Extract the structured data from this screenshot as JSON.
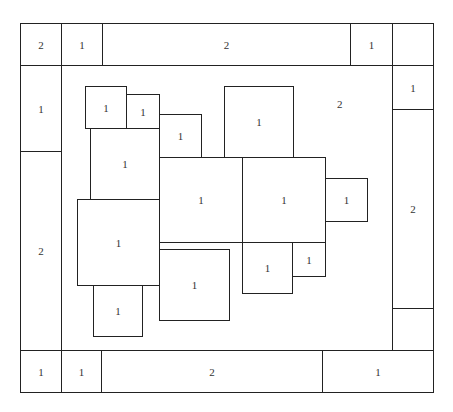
{
  "diagram": {
    "type": "rectangle-packing layout",
    "outer_frame": {
      "x": 20,
      "y": 23,
      "w": 413,
      "h": 369
    },
    "central_area": {
      "label": "2",
      "label_pos": {
        "x": 337,
        "y": 98
      }
    },
    "top_row": [
      {
        "label": "2",
        "x": 20,
        "y": 23,
        "w": 42,
        "h": 43
      },
      {
        "label": "1",
        "x": 61,
        "y": 23,
        "w": 42,
        "h": 43
      },
      {
        "label": "2",
        "x": 102,
        "y": 23,
        "w": 249,
        "h": 43
      },
      {
        "label": "1",
        "x": 350,
        "y": 23,
        "w": 43,
        "h": 43
      },
      {
        "label": "",
        "x": 392,
        "y": 23,
        "w": 41,
        "h": 43
      }
    ],
    "left_column": [
      {
        "label": "1",
        "x": 20,
        "y": 65,
        "w": 42,
        "h": 87
      },
      {
        "label": "2",
        "x": 20,
        "y": 151,
        "w": 42,
        "h": 200
      }
    ],
    "right_column": [
      {
        "label": "1",
        "x": 392,
        "y": 65,
        "w": 41,
        "h": 45
      },
      {
        "label": "2",
        "x": 392,
        "y": 109,
        "w": 41,
        "h": 200
      },
      {
        "label": "",
        "x": 392,
        "y": 308,
        "w": 41,
        "h": 43
      }
    ],
    "bottom_row": [
      {
        "label": "1",
        "x": 20,
        "y": 350,
        "w": 42,
        "h": 42
      },
      {
        "label": "1",
        "x": 61,
        "y": 350,
        "w": 41,
        "h": 42
      },
      {
        "label": "2",
        "x": 101,
        "y": 350,
        "w": 222,
        "h": 42
      },
      {
        "label": "1",
        "x": 322,
        "y": 350,
        "w": 111,
        "h": 42
      }
    ],
    "inner_boxes": [
      {
        "label": "1",
        "x": 85,
        "y": 86,
        "w": 42,
        "h": 43
      },
      {
        "label": "1",
        "x": 126,
        "y": 94,
        "w": 34,
        "h": 35
      },
      {
        "label": "1",
        "x": 159,
        "y": 114,
        "w": 43,
        "h": 44
      },
      {
        "label": "1",
        "x": 224,
        "y": 86,
        "w": 70,
        "h": 72
      },
      {
        "label": "1",
        "x": 90,
        "y": 128,
        "w": 70,
        "h": 72
      },
      {
        "label": "1",
        "x": 159,
        "y": 157,
        "w": 84,
        "h": 86
      },
      {
        "label": "1",
        "x": 242,
        "y": 157,
        "w": 84,
        "h": 86
      },
      {
        "label": "1",
        "x": 325,
        "y": 178,
        "w": 43,
        "h": 44
      },
      {
        "label": "1",
        "x": 77,
        "y": 199,
        "w": 83,
        "h": 87
      },
      {
        "label": "1",
        "x": 93,
        "y": 285,
        "w": 50,
        "h": 52
      },
      {
        "label": "1",
        "x": 159,
        "y": 249,
        "w": 71,
        "h": 72
      },
      {
        "label": "1",
        "x": 242,
        "y": 242,
        "w": 51,
        "h": 52
      },
      {
        "label": "1",
        "x": 292,
        "y": 242,
        "w": 34,
        "h": 35
      }
    ]
  }
}
